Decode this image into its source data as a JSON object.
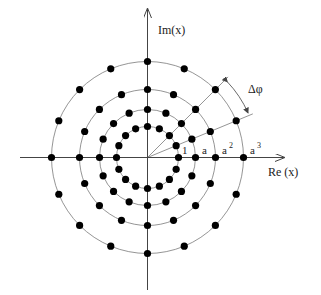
{
  "diagram": {
    "center": [
      147.5,
      157.5
    ],
    "axes": {
      "x_label": "Re (x)",
      "y_label": "Im(x)",
      "x_range": [
        20,
        284
      ],
      "y_range": [
        8,
        290
      ]
    },
    "rings": [
      {
        "label": "1",
        "radius": 31,
        "dots": 16
      },
      {
        "label": "a",
        "radius": 48,
        "dots": 16
      },
      {
        "label": "a²",
        "radius": 68,
        "dots": 16
      },
      {
        "label": "a³",
        "radius": 96,
        "dots": 16
      }
    ],
    "ring_labels": {
      "r1": "1",
      "r2": "a",
      "r3_base": "a",
      "r3_exp": "2",
      "r4_base": "a",
      "r4_exp": "3"
    },
    "angle_step_deg": 22.5,
    "angle_annotation": "Δφ",
    "rays_deg": [
      22.5,
      45
    ],
    "colors": {
      "dot": "#000000",
      "ring": "#7a7a7a",
      "axis": "#444444",
      "background": "#ffffff"
    }
  }
}
